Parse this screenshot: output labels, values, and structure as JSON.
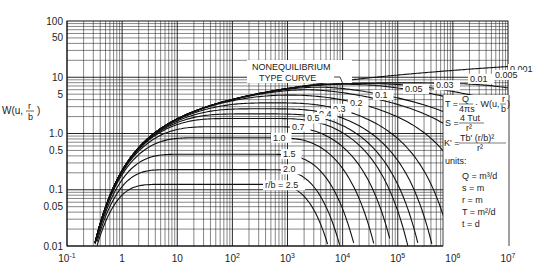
{
  "chart_data": {
    "type": "line",
    "xlabel": "",
    "ylabel": "W(u, r/b)",
    "xscale": "log",
    "yscale": "log",
    "xlim": [
      0.1,
      10000000
    ],
    "ylim": [
      0.01,
      100
    ],
    "grid": true,
    "x_tick_labels": [
      "10^-1",
      "1",
      "10",
      "10^2",
      "10^3",
      "10^4",
      "10^5",
      "10^6",
      "10^7"
    ],
    "y_tick_labels": [
      "100",
      "50",
      "10",
      "5",
      "1.0",
      "0.5",
      "0.1",
      "0.05",
      "0.01"
    ],
    "annotation": "NONEQUILIBRIUM TYPE CURVE",
    "series_label_prefix": "r/b =",
    "series": [
      {
        "name": "0.001",
        "plateau": 14.0
      },
      {
        "name": "0.005",
        "plateau": 11.0
      },
      {
        "name": "0.01",
        "plateau": 9.4
      },
      {
        "name": "0.03",
        "plateau": 7.2
      },
      {
        "name": "0.05",
        "plateau": 6.2
      },
      {
        "name": "0.1",
        "plateau": 4.85
      },
      {
        "name": "0.2",
        "plateau": 3.5
      },
      {
        "name": "0.3",
        "plateau": 2.75
      },
      {
        "name": "0.4",
        "plateau": 2.23
      },
      {
        "name": "0.5",
        "plateau": 1.85
      },
      {
        "name": "0.7",
        "plateau": 1.33
      },
      {
        "name": "1.0",
        "plateau": 0.84
      },
      {
        "name": "1.5",
        "plateau": 0.43
      },
      {
        "name": "2.0",
        "plateau": 0.23
      },
      {
        "name": "2.5",
        "plateau": 0.12
      }
    ],
    "equations": [
      "T = Q/(4πs) · W(u, r/b)",
      "S = 4Tut / r²",
      "K' = Tb'(r/b)² / r²"
    ],
    "units": [
      "Q = m³/d",
      "s = m",
      "r = m",
      "T = m²/d",
      "t = d"
    ]
  },
  "labels": {
    "ylabel_main": "W(u,",
    "ylabel_frac_num": "r",
    "ylabel_frac_den": "b",
    "ylabel_close": ")",
    "annot_line1": "NONEQUILIBRIUM",
    "annot_line2": "TYPE  CURVE",
    "rb_prefix": "r/b = 2.5",
    "units_title": "units:",
    "eq_T_left": "T =",
    "eq_T_num": "Q",
    "eq_T_den": "4πs",
    "eq_T_right": "· W(u,",
    "eq_T_fnum": "r",
    "eq_T_fden": "b",
    "eq_T_close": ")",
    "eq_S_left": "S =",
    "eq_S_num": "4 Tut",
    "eq_S_den": "r²",
    "eq_K_left": "K' =",
    "eq_K_num": "Tb' (r/b)²",
    "eq_K_den": "r²",
    "unit_Q": "Q = m³/d",
    "unit_s": "s = m",
    "unit_r": "r = m",
    "unit_T": "T = m²/d",
    "unit_t": "t = d"
  }
}
